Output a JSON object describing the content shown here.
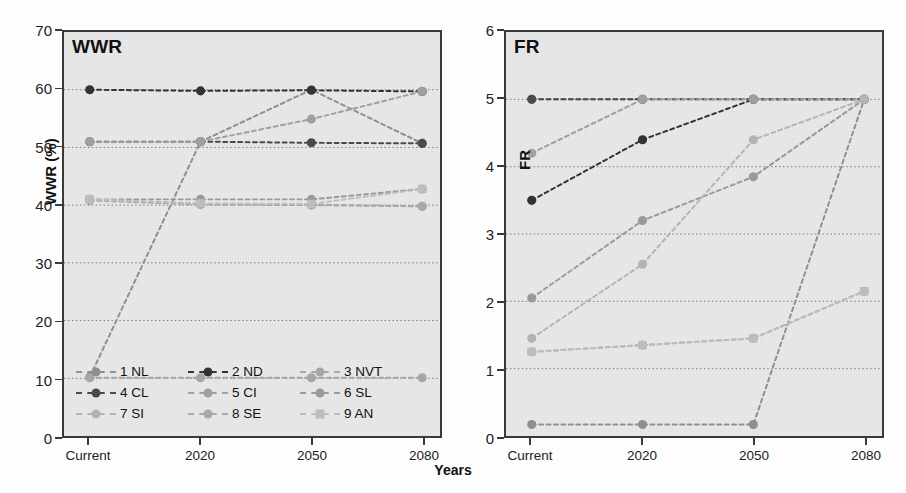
{
  "figure": {
    "xaxis_title": "Years",
    "categories": [
      "Current",
      "2020",
      "2050",
      "2080"
    ]
  },
  "panels": {
    "left": {
      "title": "WWR",
      "ylabel": "WWR (%)",
      "yticks": [
        "0",
        "10",
        "20",
        "30",
        "40",
        "50",
        "60",
        "70"
      ]
    },
    "right": {
      "title": "FR",
      "ylabel": "FR",
      "yticks": [
        "0",
        "1",
        "2",
        "3",
        "4",
        "5",
        "6"
      ]
    }
  },
  "legend": {
    "rows": [
      [
        {
          "label": "1 NL",
          "color": "#8f8f8f",
          "marker": "circle"
        },
        {
          "label": "2 ND",
          "color": "#333333",
          "marker": "circle"
        },
        {
          "label": "3 NVT",
          "color": "#a6a6a6",
          "marker": "circle"
        }
      ],
      [
        {
          "label": "4 CL",
          "color": "#4a4a4a",
          "marker": "circle"
        },
        {
          "label": "5 CI",
          "color": "#a0a0a0",
          "marker": "circle"
        },
        {
          "label": "6 SL",
          "color": "#9a9a9a",
          "marker": "circle"
        }
      ],
      [
        {
          "label": "7 SI",
          "color": "#b4b4b4",
          "marker": "circle"
        },
        {
          "label": "8 SE",
          "color": "#a8a8a8",
          "marker": "circle"
        },
        {
          "label": "9 AN",
          "color": "#bdbdbd",
          "marker": "square"
        }
      ]
    ]
  },
  "chart_data": [
    {
      "type": "line",
      "title": "WWR",
      "xlabel": "Years",
      "ylabel": "WWR (%)",
      "categories": [
        "Current",
        "2020",
        "2050",
        "2080"
      ],
      "ylim": [
        0,
        70
      ],
      "ytick_step": 10,
      "grid": true,
      "legend_position": "bottom-inside",
      "series": [
        {
          "name": "1 NL",
          "color": "#8f8f8f",
          "marker": "circle",
          "values": [
            10.2,
            51.0,
            60.0,
            50.7
          ]
        },
        {
          "name": "2 ND",
          "color": "#333333",
          "marker": "circle",
          "values": [
            60.0,
            59.8,
            59.9,
            59.7
          ]
        },
        {
          "name": "3 NVT",
          "color": "#a6a6a6",
          "marker": "circle",
          "values": [
            10.1,
            10.1,
            10.1,
            10.1
          ]
        },
        {
          "name": "4 CL",
          "color": "#4a4a4a",
          "marker": "circle",
          "values": [
            51.0,
            51.0,
            50.8,
            50.7
          ]
        },
        {
          "name": "5 CI",
          "color": "#a0a0a0",
          "marker": "circle",
          "values": [
            51.0,
            51.0,
            54.9,
            59.7
          ]
        },
        {
          "name": "6 SL",
          "color": "#9a9a9a",
          "marker": "circle",
          "values": [
            41.0,
            41.0,
            41.0,
            42.8
          ]
        },
        {
          "name": "7 SI",
          "color": "#b4b4b4",
          "marker": "circle",
          "values": [
            41.0,
            40.2,
            40.1,
            39.8
          ]
        },
        {
          "name": "8 SE",
          "color": "#a8a8a8",
          "marker": "circle",
          "values": [
            40.8,
            40.1,
            40.0,
            39.8
          ]
        },
        {
          "name": "9 AN",
          "color": "#bdbdbd",
          "marker": "square",
          "values": [
            41.0,
            40.3,
            40.2,
            42.8
          ]
        }
      ]
    },
    {
      "type": "line",
      "title": "FR",
      "xlabel": "Years",
      "ylabel": "FR",
      "categories": [
        "Current",
        "2020",
        "2050",
        "2080"
      ],
      "ylim": [
        0,
        6
      ],
      "ytick_step": 1,
      "grid": true,
      "legend_position": "shared-with-left-panel",
      "series": [
        {
          "name": "1 NL",
          "color": "#8f8f8f",
          "marker": "circle",
          "values": [
            0.17,
            0.17,
            0.17,
            5.0
          ]
        },
        {
          "name": "2 ND",
          "color": "#333333",
          "marker": "circle",
          "values": [
            3.5,
            4.4,
            5.0,
            5.0
          ]
        },
        {
          "name": "3 NVT",
          "color": "#a6a6a6",
          "marker": "circle",
          "values": [
            5.0,
            5.0,
            5.0,
            5.0
          ]
        },
        {
          "name": "4 CL",
          "color": "#4a4a4a",
          "marker": "circle",
          "values": [
            5.0,
            5.0,
            5.0,
            5.0
          ]
        },
        {
          "name": "5 CI",
          "color": "#a0a0a0",
          "marker": "circle",
          "values": [
            4.2,
            5.0,
            5.0,
            5.0
          ]
        },
        {
          "name": "6 SL",
          "color": "#9a9a9a",
          "marker": "circle",
          "values": [
            2.05,
            3.2,
            3.85,
            5.0
          ]
        },
        {
          "name": "7 SI",
          "color": "#b4b4b4",
          "marker": "circle",
          "values": [
            1.45,
            2.55,
            4.4,
            5.0
          ]
        },
        {
          "name": "8 SE",
          "color": "#a8a8a8",
          "marker": "circle",
          "values": [
            1.25,
            1.35,
            1.45,
            2.15
          ]
        },
        {
          "name": "9 AN",
          "color": "#bdbdbd",
          "marker": "square",
          "values": [
            1.25,
            1.35,
            1.45,
            2.15
          ]
        }
      ]
    }
  ]
}
